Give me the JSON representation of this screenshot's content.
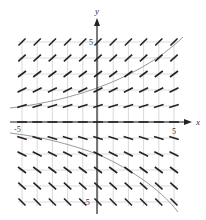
{
  "diagram": {
    "type": "slope-field",
    "title": "",
    "axes": {
      "x_label": "x",
      "y_label": "y",
      "x_tick_labels": [
        "-5",
        "5"
      ],
      "y_tick_labels": [
        "5",
        "-5"
      ],
      "x_range": [
        -5,
        5
      ],
      "y_range": [
        -5,
        5
      ]
    },
    "grid": {
      "columns": 11,
      "rows": 11,
      "x_values": [
        -5,
        -4,
        -3,
        -2,
        -1,
        0,
        1,
        2,
        3,
        4,
        5
      ],
      "y_values": [
        5,
        4,
        3,
        2,
        1,
        0,
        -1,
        -2,
        -3,
        -4,
        -5
      ]
    },
    "slope_segments_description": "Slope depends only on y: positive and steep at top, zero along x-axis, negative and steep at bottom",
    "row_slopes": [
      1.0,
      0.9,
      0.75,
      0.5,
      0.3,
      0.0,
      -0.3,
      -0.5,
      -0.75,
      -0.9,
      -1.0
    ],
    "solution_curves": [
      {
        "name": "upper-solution-curve",
        "description": "increasing curve from lower-left above x-axis rising to upper-right"
      },
      {
        "name": "lower-solution-curve",
        "description": "decreasing curve from left below x-axis falling to lower-right"
      }
    ],
    "colors": {
      "grid": "#d0d0d0",
      "axes": "#222222",
      "segments": "#222222",
      "curves": "#999999"
    }
  }
}
